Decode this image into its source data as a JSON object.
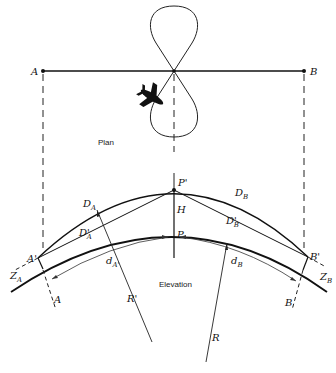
{
  "diagram": {
    "title_plan": "Plan",
    "title_elevation": "Elevation",
    "colors": {
      "ink": "#111111",
      "background": "#ffffff"
    },
    "plan": {
      "point_a": "A",
      "point_b": "B",
      "path": "figure-eight flight path",
      "aircraft_icon": "airplane-icon"
    },
    "elevation": {
      "p_prime": "P'",
      "p": "P",
      "h": "H",
      "a_prime": "A'",
      "b_prime": "B'",
      "a": "A",
      "b": "B",
      "d_a": "D",
      "d_a_sub": "A",
      "d_b": "D",
      "d_b_sub": "B",
      "d_a_prime": "D'",
      "d_a_prime_sub": "A",
      "d_b_prime": "D'",
      "d_b_prime_sub": "B",
      "small_d_a": "d",
      "small_d_a_sub": "A'",
      "small_d_b": "d",
      "small_d_b_sub": "B",
      "z_a": "Z",
      "z_a_sub": "A",
      "z_b": "Z",
      "z_b_sub": "B",
      "r_prime": "R'",
      "r": "R"
    }
  }
}
